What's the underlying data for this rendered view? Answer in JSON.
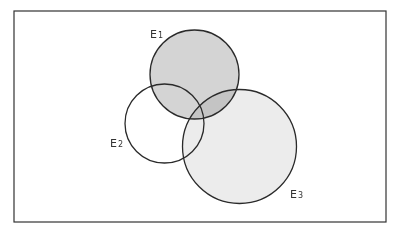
{
  "diagram": {
    "type": "venn",
    "frame": {
      "x": 14,
      "y": 11,
      "width": 372,
      "height": 211
    },
    "sets": [
      {
        "id": "E1",
        "label": "E",
        "subscript": "1",
        "cx": 194.5,
        "cy": 74.5,
        "r": 44.5,
        "fill": "#d4d4d4",
        "label_x": 150,
        "label_y": 38
      },
      {
        "id": "E2",
        "label": "E",
        "subscript": "2",
        "cx": 164.5,
        "cy": 123.5,
        "r": 39.5,
        "fill": "#ffffff",
        "label_x": 110,
        "label_y": 147
      },
      {
        "id": "E3",
        "label": "E",
        "subscript": "3",
        "cx": 239.5,
        "cy": 146.5,
        "r": 57,
        "fill": "#ececec",
        "label_x": 290,
        "label_y": 198
      }
    ],
    "overlap_color": "#b8b8b8"
  }
}
